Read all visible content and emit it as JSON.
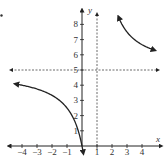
{
  "chart_data": {
    "type": "line",
    "title": "",
    "function": "y = 5x/(x-1)",
    "xlabel": "x",
    "ylabel": "y",
    "xlim": [
      -4.5,
      5
    ],
    "ylim": [
      -0.5,
      8.5
    ],
    "x_ticks": [
      "-4",
      "-3",
      "-2",
      "-1",
      "1",
      "2",
      "3",
      "4"
    ],
    "y_ticks": [
      "1",
      "2",
      "3",
      "4",
      "5",
      "6",
      "7",
      "8"
    ],
    "asymptotes": {
      "vertical": {
        "x": 1,
        "style": "dashed"
      },
      "horizontal": {
        "y": 5,
        "style": "dashed"
      }
    },
    "series": [
      {
        "name": "left branch",
        "points": [
          [
            -4.4,
            4.07
          ],
          [
            -4,
            4.0
          ],
          [
            -3,
            3.75
          ],
          [
            -2,
            3.33
          ],
          [
            -1,
            2.5
          ],
          [
            -0.5,
            1.67
          ],
          [
            0,
            0
          ],
          [
            0.08,
            -0.43
          ]
        ]
      },
      {
        "name": "right branch",
        "points": [
          [
            2.45,
            8.45
          ],
          [
            3,
            7.5
          ],
          [
            4,
            6.67
          ],
          [
            4.8,
            6.32
          ]
        ]
      }
    ],
    "grid": false,
    "legend": null
  },
  "labels": {
    "x_axis": "x",
    "y_axis": "y",
    "marker": "."
  }
}
